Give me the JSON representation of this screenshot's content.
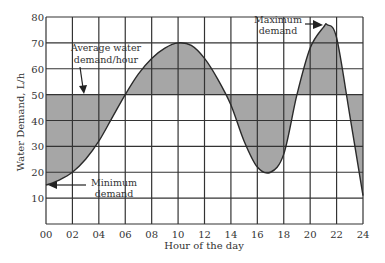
{
  "chart_data": {
    "type": "line",
    "title": "",
    "xlabel": "Hour of the day",
    "ylabel": "Water Demand, L/h",
    "xlim": [
      0,
      24
    ],
    "ylim": [
      0,
      80
    ],
    "x_ticks": [
      "00",
      "02",
      "04",
      "06",
      "08",
      "10",
      "12",
      "14",
      "16",
      "18",
      "20",
      "22",
      "24"
    ],
    "y_ticks": [
      "10",
      "20",
      "30",
      "40",
      "50",
      "60",
      "70",
      "80"
    ],
    "grid": true,
    "legend": "none",
    "average_line": 50,
    "series": [
      {
        "name": "Water demand",
        "x": [
          0,
          1,
          2,
          3,
          4,
          5,
          6,
          7,
          8,
          9,
          10,
          11,
          12,
          13,
          14,
          15,
          16,
          17,
          18,
          19,
          20,
          21,
          21.3,
          22,
          23,
          24
        ],
        "values": [
          15,
          17,
          20,
          25,
          32,
          41,
          50,
          58,
          64,
          68,
          70,
          69,
          64,
          56,
          46,
          32,
          22,
          20,
          27,
          50,
          68,
          76,
          77,
          72,
          42,
          11
        ]
      }
    ],
    "shading": "Area between demand curve and average line (50) is shaded gray",
    "annotations": [
      {
        "text_lines": [
          "Average water",
          "demand/hour"
        ],
        "points_to": [
          4,
          50
        ]
      },
      {
        "text_lines": [
          "Minimum",
          "demand"
        ],
        "points_to": [
          0,
          15
        ]
      },
      {
        "text_lines": [
          "Maximum",
          "demand"
        ],
        "points_to": [
          21.3,
          77
        ]
      }
    ]
  },
  "colors": {
    "fill": "#a6a6a6",
    "grid": "#333333",
    "curve": "#2a2a2a",
    "text": "#333333"
  }
}
